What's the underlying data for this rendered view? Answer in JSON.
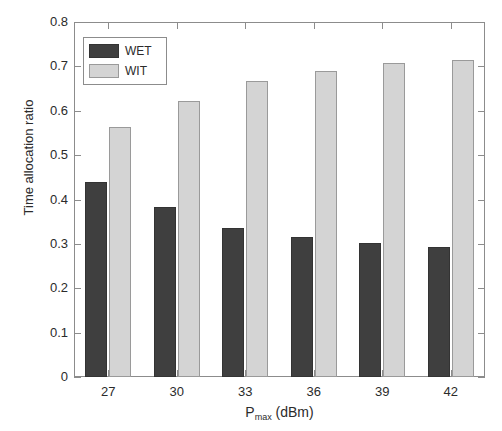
{
  "chart_data": {
    "type": "bar",
    "title": "",
    "xlabel": "P_max (dBm)",
    "xlabel_base": "P",
    "xlabel_sub": "max",
    "xlabel_unit": "(dBm)",
    "ylabel": "Time allocation ratio",
    "categories": [
      "27",
      "30",
      "33",
      "36",
      "39",
      "42"
    ],
    "series": [
      {
        "name": "WET",
        "color": "#3f3f3f",
        "values": [
          0.439,
          0.382,
          0.335,
          0.315,
          0.302,
          0.294
        ]
      },
      {
        "name": "WIT",
        "color": "#d4d4d4",
        "values": [
          0.563,
          0.622,
          0.668,
          0.69,
          0.707,
          0.715
        ]
      }
    ],
    "ylim": [
      0,
      0.8
    ],
    "ytick_labels": [
      "0",
      "0.1",
      "0.2",
      "0.3",
      "0.4",
      "0.5",
      "0.6",
      "0.7",
      "0.8"
    ],
    "ytick_values": [
      0,
      0.1,
      0.2,
      0.3,
      0.4,
      0.5,
      0.6,
      0.7,
      0.8
    ],
    "grid": false,
    "legend_position": "upper-left",
    "axis_color": "#8c8c8c",
    "text_color": "#2b2b2b",
    "background": "#ffffff"
  },
  "legend": {
    "entries": [
      {
        "label": "WET",
        "color": "#3f3f3f"
      },
      {
        "label": "WIT",
        "color": "#d4d4d4"
      }
    ]
  }
}
